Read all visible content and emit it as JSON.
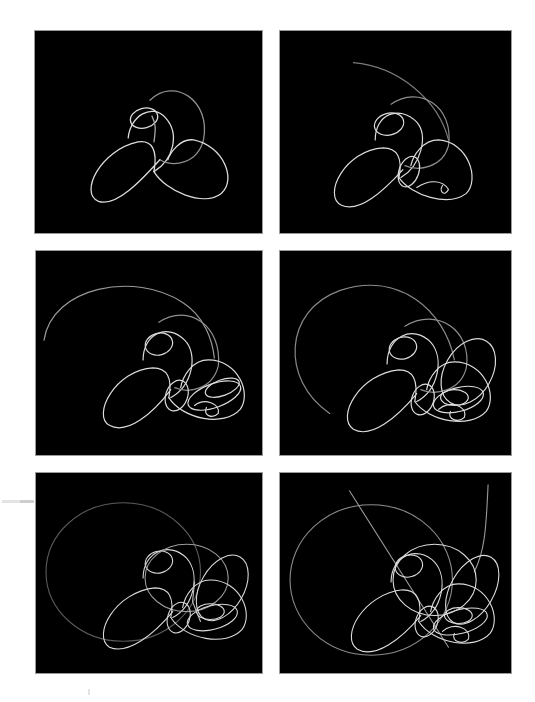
{
  "figure": {
    "panel_count": 6,
    "layout": "3 rows x 2 columns",
    "background_color": "#000000",
    "trace_color": "#d9d9d9",
    "page_color": "#ffffff"
  },
  "panels": [
    {
      "index": 1,
      "position": "row1-left",
      "description": "orbit trace, early stage: trefoil of three loops with small inner loop"
    },
    {
      "index": 2,
      "position": "row1-right",
      "description": "orbit trace, more loops plus long arc to upper left"
    },
    {
      "index": 3,
      "position": "row2-left",
      "description": "orbit trace, dense tangle lower right, wide arc at left"
    },
    {
      "index": 4,
      "position": "row2-right",
      "description": "orbit trace, dense tangle with large open arc on left"
    },
    {
      "index": 5,
      "position": "row3-left",
      "description": "orbit trace, faint large ellipse plus dense tangle"
    },
    {
      "index": 6,
      "position": "row3-right",
      "description": "orbit trace, large ellipse, tangle and two straight escape lines"
    }
  ]
}
